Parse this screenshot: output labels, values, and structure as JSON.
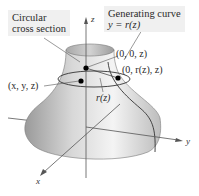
{
  "diagram": {
    "type": "surface-of-revolution",
    "labels": {
      "circular_cross_section_line1": "Circular",
      "circular_cross_section_line2": "cross section",
      "generating_curve_line1": "Generating curve",
      "generating_curve_line2": "y = r(z)",
      "point_axis": "(0, 0, z)",
      "point_curve": "(0, r(z), z)",
      "point_general": "(x, y, z)",
      "radius": "r(z)"
    },
    "axes": {
      "x": "x",
      "y": "y",
      "z": "z"
    },
    "colors": {
      "surface_light": "#f2f2f2",
      "surface_mid": "#c8c8c8",
      "surface_dark": "#8a8a8a",
      "label_box_bg": "#f0f0f0",
      "axis_line": "#555555",
      "point": "#000000"
    }
  }
}
